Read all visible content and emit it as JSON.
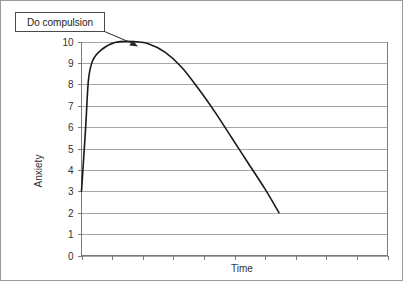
{
  "chart_data": {
    "type": "line",
    "title": "",
    "xlabel": "Time",
    "ylabel": "Anxiety",
    "ylim": [
      0,
      10
    ],
    "ytick_labels": [
      "0",
      "1",
      "2",
      "3",
      "4",
      "5",
      "6",
      "7",
      "8",
      "9",
      "10"
    ],
    "ytick_values": [
      0,
      1,
      2,
      3,
      4,
      5,
      6,
      7,
      8,
      9,
      10
    ],
    "xtick_labels": [],
    "xtick_count": 11,
    "grid": true,
    "legend": false,
    "series": [
      {
        "name": "Anxiety over time",
        "points": [
          [
            0.0,
            3.0
          ],
          [
            0.15,
            6.0
          ],
          [
            0.25,
            8.2
          ],
          [
            0.4,
            9.1
          ],
          [
            0.7,
            9.6
          ],
          [
            1.2,
            9.95
          ],
          [
            1.8,
            10.0
          ],
          [
            2.4,
            9.9
          ],
          [
            3.0,
            9.5
          ],
          [
            3.6,
            8.8
          ],
          [
            4.2,
            7.8
          ],
          [
            4.8,
            6.7
          ],
          [
            5.4,
            5.5
          ],
          [
            6.0,
            4.3
          ],
          [
            6.6,
            3.1
          ],
          [
            7.1,
            2.0
          ]
        ]
      }
    ],
    "annotations": [
      {
        "label": "Do compulsion",
        "target_description": "peak of anxiety curve at value 10"
      }
    ]
  },
  "callout": {
    "text": "Do compulsion"
  },
  "axes": {
    "y_title": "Anxiety",
    "x_title": "Time",
    "y_labels": [
      "10",
      "9",
      "8",
      "7",
      "6",
      "5",
      "4",
      "3",
      "2",
      "1",
      "0"
    ]
  }
}
